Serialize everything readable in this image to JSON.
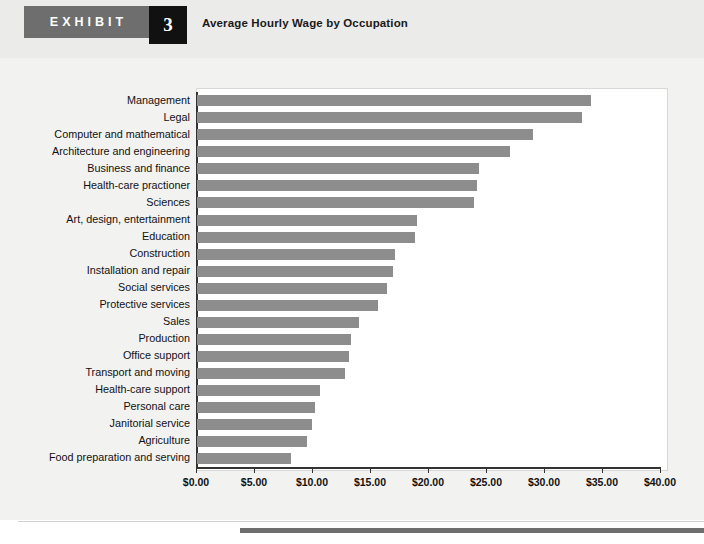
{
  "header": {
    "exhibit_label": "EXHIBIT",
    "exhibit_number": "3",
    "title": "Average Hourly Wage by Occupation",
    "tab_color": "#6e6e6e",
    "number_box_color": "#111111"
  },
  "chart_data": {
    "type": "bar",
    "orientation": "horizontal",
    "title": "Average Hourly Wage by Occupation",
    "xlabel": "",
    "ylabel": "",
    "xlim": [
      0,
      40
    ],
    "grid": false,
    "legend": false,
    "bar_color": "#8d8d8d",
    "tick_labels": [
      "$0.00",
      "$5.00",
      "$10.00",
      "$15.00",
      "$20.00",
      "$25.00",
      "$30.00",
      "$35.00",
      "$40.00"
    ],
    "tick_values": [
      0,
      5,
      10,
      15,
      20,
      25,
      30,
      35,
      40
    ],
    "categories": [
      "Management",
      "Legal",
      "Computer and mathematical",
      "Architecture and engineering",
      "Business and finance",
      "Health-care practioner",
      "Sciences",
      "Art, design, entertainment",
      "Education",
      "Construction",
      "Installation and repair",
      "Social services",
      "Protective services",
      "Sales",
      "Production",
      "Office support",
      "Transport and moving",
      "Health-care support",
      "Personal care",
      "Janitorial service",
      "Agriculture",
      "Food preparation and serving"
    ],
    "values": [
      34.0,
      33.2,
      29.0,
      27.0,
      24.3,
      24.1,
      23.9,
      19.0,
      18.8,
      17.1,
      16.9,
      16.4,
      15.6,
      14.0,
      13.3,
      13.1,
      12.8,
      10.6,
      10.2,
      9.9,
      9.5,
      8.1
    ]
  }
}
